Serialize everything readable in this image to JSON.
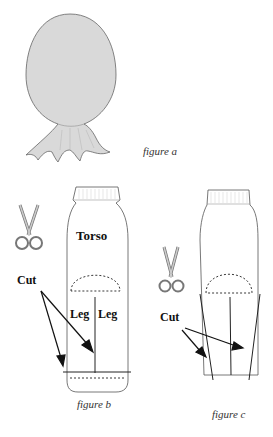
{
  "figures": [
    {
      "id": "a",
      "caption": "figure a",
      "description": "Sock stuffed and tied into a balloon-shaped head with ruffled open end",
      "fill_color": "#d9d9d9"
    },
    {
      "id": "b",
      "caption": "figure b",
      "labels": {
        "torso": "Torso",
        "leg_left": "Leg",
        "leg_right": "Leg",
        "cut": "Cut"
      },
      "description": "Sock marked with torso area, dashed arc, center cut line splitting two legs, and cut line across foot"
    },
    {
      "id": "c",
      "caption": "figure c",
      "labels": {
        "cut": "Cut"
      },
      "description": "Sock with dashed arc and angled cut lines along both sides plus center cut"
    }
  ],
  "icons": [
    "scissors-icon",
    "scissors-icon"
  ],
  "colors": {
    "outline": "#555555",
    "stroke": "#111111",
    "sock_fill": "#ffffff",
    "head_fill": "#d9d9d9"
  }
}
